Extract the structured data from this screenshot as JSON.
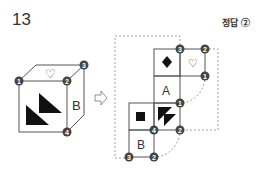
{
  "question": {
    "number": "13"
  },
  "answer": {
    "label": "정답 ②"
  },
  "cube": {
    "front_symbol": "two black triangles",
    "top_symbol": "♡",
    "right_label": "B",
    "vertices": [
      "1",
      "2",
      "3",
      "4"
    ]
  },
  "arrow": {
    "symbol": "⇨"
  },
  "net": {
    "faces": [
      {
        "pos": "top-left",
        "symbol": "◆"
      },
      {
        "pos": "top-right",
        "symbol": "♡"
      },
      {
        "pos": "middle",
        "label": "A"
      },
      {
        "pos": "lower-left",
        "symbol": "■"
      },
      {
        "pos": "lower-right",
        "symbol": "two black triangles"
      },
      {
        "pos": "bottom",
        "label": "B"
      }
    ],
    "vertices": [
      "3",
      "2",
      "1",
      "1",
      "4",
      "2",
      "3",
      "2"
    ]
  },
  "labels": {
    "heart": "♡",
    "B": "B",
    "A": "A",
    "n1": "1",
    "n2": "2",
    "n3": "3",
    "n4": "4"
  }
}
